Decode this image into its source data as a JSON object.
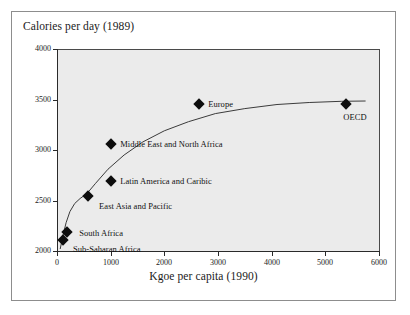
{
  "figure": {
    "y_axis_title": "Calories per day (1989)",
    "x_axis_title": "Kgoe per capita (1990)"
  },
  "chart_data": {
    "type": "scatter",
    "title": "",
    "xlabel": "Kgoe per capita (1990)",
    "ylabel": "Calories per day (1989)",
    "xlim": [
      0,
      6000
    ],
    "ylim": [
      2000,
      4000
    ],
    "xticks": [
      0,
      1000,
      2000,
      3000,
      4000,
      5000,
      6000
    ],
    "yticks": [
      2000,
      2500,
      3000,
      3500,
      4000
    ],
    "xtick_labels": [
      "0",
      "1000",
      "2000",
      "3000",
      "4000",
      "5000",
      "6000"
    ],
    "ytick_labels": [
      "2000",
      "2500",
      "3000",
      "3500",
      "4000"
    ],
    "grid": false,
    "legend": "none",
    "plot_background": "#ebebeb",
    "marker_color": "#0d0d0d",
    "trend_line_color": "#3b3b3b",
    "points": [
      {
        "label": "Sub-Saharan Africa",
        "x": 110,
        "y": 2110,
        "label_dx": 10,
        "label_dy": 9
      },
      {
        "label": "South Africa",
        "x": 190,
        "y": 2190,
        "label_dx": 12,
        "label_dy": 1
      },
      {
        "label": "East Asia and Pacific",
        "x": 580,
        "y": 2545,
        "label_dx": 11,
        "label_dy": 10
      },
      {
        "label": "Latin America and Caribic",
        "x": 1010,
        "y": 2690,
        "label_dx": 9,
        "label_dy": 0
      },
      {
        "label": "Middle East and North Africa",
        "x": 1010,
        "y": 3060,
        "label_dx": 9,
        "label_dy": 0
      },
      {
        "label": "Europe",
        "x": 2650,
        "y": 3455,
        "label_dx": 9,
        "label_dy": 0
      },
      {
        "label": "OECD",
        "x": 5390,
        "y": 3455,
        "label_dx": -3,
        "label_dy": 13
      }
    ],
    "trend_line": [
      {
        "x": 60,
        "y": 2030
      },
      {
        "x": 110,
        "y": 2160
      },
      {
        "x": 170,
        "y": 2290
      },
      {
        "x": 240,
        "y": 2400
      },
      {
        "x": 330,
        "y": 2480
      },
      {
        "x": 430,
        "y": 2530
      },
      {
        "x": 560,
        "y": 2580
      },
      {
        "x": 720,
        "y": 2680
      },
      {
        "x": 950,
        "y": 2820
      },
      {
        "x": 1250,
        "y": 2960
      },
      {
        "x": 1600,
        "y": 3090
      },
      {
        "x": 2000,
        "y": 3200
      },
      {
        "x": 2450,
        "y": 3290
      },
      {
        "x": 2950,
        "y": 3370
      },
      {
        "x": 3500,
        "y": 3420
      },
      {
        "x": 4100,
        "y": 3460
      },
      {
        "x": 4700,
        "y": 3480
      },
      {
        "x": 5300,
        "y": 3492
      },
      {
        "x": 5750,
        "y": 3495
      }
    ]
  }
}
